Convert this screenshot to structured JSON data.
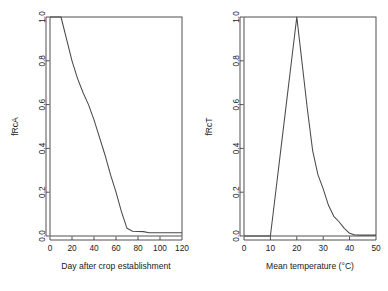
{
  "figure": {
    "background": "#ffffff",
    "line_color": "#4a4a4a",
    "axis_color": "#3d3d3d",
    "panel_count": 2
  },
  "chart_data": [
    {
      "type": "line",
      "panel": "left",
      "title": "",
      "xlabel": "Day after crop establishment",
      "ylabel": "fRcA",
      "xlim": [
        0,
        120
      ],
      "ylim": [
        0.0,
        1.0
      ],
      "xticks": [
        0,
        20,
        40,
        60,
        80,
        100,
        120
      ],
      "xticklabels": [
        "0",
        "20",
        "40",
        "60",
        "80",
        "100",
        "120"
      ],
      "yticks": [
        0.0,
        0.2,
        0.4,
        0.6,
        0.8,
        1.0
      ],
      "yticklabels": [
        "0.0",
        "0.2",
        "0.4",
        "0.6",
        "0.8",
        "1.0"
      ],
      "grid": false,
      "legend": null,
      "x": [
        0,
        5,
        10,
        15,
        20,
        25,
        30,
        35,
        40,
        45,
        50,
        55,
        60,
        65,
        70,
        75,
        80,
        85,
        90,
        95,
        100,
        105,
        110,
        115,
        120
      ],
      "y": [
        1.0,
        1.0,
        1.0,
        0.9,
        0.8,
        0.72,
        0.655,
        0.6,
        0.53,
        0.45,
        0.37,
        0.28,
        0.2,
        0.11,
        0.035,
        0.022,
        0.021,
        0.02,
        0.015,
        0.015,
        0.015,
        0.015,
        0.015,
        0.015,
        0.015
      ]
    },
    {
      "type": "line",
      "panel": "right",
      "title": "",
      "xlabel": "Mean temperature (°C)",
      "ylabel": "fRcT",
      "xlim": [
        0,
        50
      ],
      "ylim": [
        0.0,
        1.0
      ],
      "xticks": [
        0,
        10,
        20,
        30,
        40,
        50
      ],
      "xticklabels": [
        "0",
        "10",
        "20",
        "30",
        "40",
        "50"
      ],
      "yticks": [
        0.0,
        0.2,
        0.4,
        0.6,
        0.8,
        1.0
      ],
      "yticklabels": [
        "0.0",
        "0.2",
        "0.4",
        "0.6",
        "0.8",
        "1.0"
      ],
      "grid": false,
      "legend": null,
      "x": [
        0,
        2,
        4,
        6,
        8,
        10,
        12,
        14,
        16,
        18,
        20,
        22,
        24,
        26,
        28,
        30,
        32,
        34,
        36,
        38,
        40,
        42,
        44,
        46,
        48,
        50
      ],
      "y": [
        0.0,
        0.0,
        0.0,
        0.0,
        0.0,
        0.0,
        0.2,
        0.4,
        0.6,
        0.8,
        1.0,
        0.79,
        0.58,
        0.39,
        0.28,
        0.215,
        0.14,
        0.09,
        0.065,
        0.035,
        0.012,
        0.005,
        0.004,
        0.004,
        0.004,
        0.004
      ]
    }
  ]
}
